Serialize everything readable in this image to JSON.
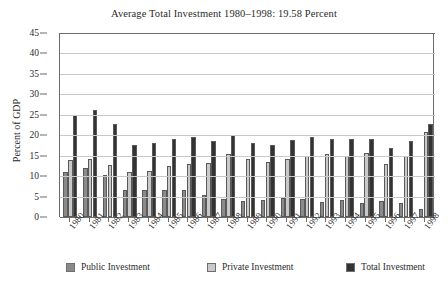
{
  "chart_data": {
    "type": "bar",
    "title": "Average Total Investment 1980–1998: 19.58 Percent",
    "xlabel": "",
    "ylabel": "Percent of GDP",
    "ylim": [
      0,
      45
    ],
    "ytick_step": 5,
    "yticks": [
      0,
      5,
      10,
      15,
      20,
      25,
      30,
      35,
      40,
      45
    ],
    "grid": true,
    "legend_position": "bottom",
    "categories": [
      "1980",
      "1981",
      "1982",
      "1983",
      "1984",
      "1985",
      "1986",
      "1987",
      "1988",
      "1989",
      "1990",
      "1991",
      "1992",
      "1993",
      "1994",
      "1995",
      "1996",
      "1997",
      "1998"
    ],
    "series": [
      {
        "name": "Public Investment",
        "color": "#8a8a8a",
        "values": [
          11.0,
          12.0,
          10.2,
          6.6,
          6.6,
          6.7,
          6.6,
          5.3,
          4.5,
          4.0,
          4.2,
          4.6,
          4.5,
          3.7,
          4.2,
          3.4,
          4.0,
          3.5,
          2.0
        ]
      },
      {
        "name": "Private Investment",
        "color": "#c9c9c9",
        "values": [
          14.0,
          14.2,
          12.6,
          11.0,
          11.2,
          12.4,
          13.0,
          13.2,
          15.5,
          14.2,
          13.4,
          14.3,
          15.0,
          15.3,
          15.0,
          15.6,
          13.0,
          15.0,
          20.7
        ]
      },
      {
        "name": "Total Investment",
        "color": "#333333",
        "values": [
          25.0,
          26.2,
          22.8,
          17.6,
          18.0,
          19.1,
          19.6,
          18.6,
          20.0,
          18.2,
          17.6,
          18.9,
          19.5,
          19.0,
          19.2,
          19.0,
          17.0,
          18.5,
          22.7
        ]
      }
    ]
  }
}
